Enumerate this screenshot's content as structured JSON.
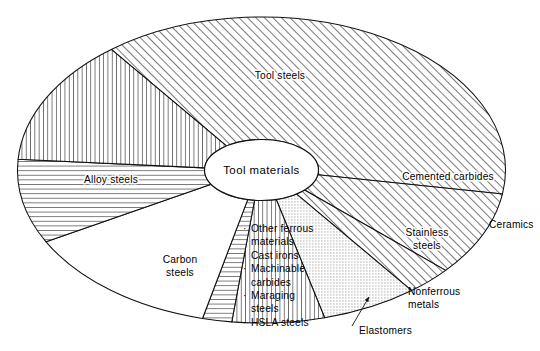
{
  "figure": {
    "hub_label": "Tool materials",
    "center": {
      "x": 261.5,
      "y": 170
    },
    "radius": {
      "x": 244,
      "y": 153
    },
    "hub_radius": {
      "x": 57,
      "y": 30.5
    }
  },
  "chart_data": {
    "type": "pie",
    "title": "Tool materials",
    "xlabel": "",
    "ylabel": "",
    "legend": "none",
    "grid": false,
    "categories": [
      "Tool steels",
      "Cemented carbides",
      "Ceramics",
      "Stainless steels",
      "Nonferrous metals",
      "Elastomers",
      "Other ferrous materials",
      "Carbon steels",
      "Alloy steels"
    ],
    "values": [
      38.0,
      9.0,
      3.0,
      6.5,
      6.0,
      2.0,
      13.5,
      8.5,
      13.5
    ],
    "units": "percent of circumference",
    "slices": [
      {
        "label": "Tool steels",
        "start_angle": 232,
        "end_angle": 369,
        "value": 38.0,
        "fill": "diagonal-hatch",
        "label_x": 280,
        "label_y": 79,
        "label_anchor": "middle",
        "label_inside": true
      },
      {
        "label": "Cemented carbides",
        "start_angle": 9,
        "end_angle": 41,
        "value": 9.0,
        "fill": "diagonal-hatch",
        "label_x": 448,
        "label_y": 180,
        "label_anchor": "middle",
        "label_inside": true
      },
      {
        "label": "Ceramics",
        "start_angle": 41,
        "end_angle": 52,
        "value": 3.0,
        "fill": "diagonal-hatch",
        "label_x": 489,
        "label_y": 228,
        "label_anchor": "start",
        "label_inside": false
      },
      {
        "label": "Stainless steels",
        "start_angle": 52,
        "end_angle": 75,
        "value": 6.5,
        "fill": "stipple",
        "label_x": 427,
        "label_y": 236,
        "label_anchor": "middle",
        "label_inside": true,
        "lines": [
          "Stainless",
          "steels"
        ]
      },
      {
        "label": "Nonferrous metals",
        "start_angle": 75,
        "end_angle": 97,
        "value": 6.0,
        "fill": "vertical-hatch",
        "label_x": 408,
        "label_y": 295,
        "label_anchor": "start",
        "label_inside": false,
        "lines": [
          "Nonferrous",
          "metals"
        ]
      },
      {
        "label": "Elastomers",
        "start_angle": 97,
        "end_angle": 104,
        "value": 2.0,
        "fill": "horizontal-hatch",
        "label_x": 359,
        "label_y": 334,
        "label_anchor": "start",
        "label_inside": false,
        "leader": {
          "x1": 352,
          "y1": 326,
          "x2": 369,
          "y2": 297
        }
      },
      {
        "label": "Other ferrous materials",
        "start_angle": 104,
        "end_angle": 152,
        "value": 13.5,
        "fill": "none",
        "label_x": 243,
        "label_y": 232,
        "label_anchor": "start",
        "label_inside": true,
        "bullets": [
          "Other ferrous",
          "materials",
          "Cast irons",
          "Machinable",
          "carbides",
          "Maraging",
          "steels",
          "HSLA steels"
        ],
        "bullet_flags": [
          true,
          false,
          true,
          true,
          false,
          true,
          false,
          true
        ]
      },
      {
        "label": "Carbon steels",
        "start_angle": 152,
        "end_angle": 184,
        "value": 8.5,
        "fill": "horizontal-hatch",
        "label_x": 180,
        "label_y": 263,
        "label_anchor": "middle",
        "label_inside": true,
        "lines": [
          "Carbon",
          "steels"
        ]
      },
      {
        "label": "Alloy steels",
        "start_angle": 184,
        "end_angle": 232,
        "value": 13.5,
        "fill": "vertical-hatch",
        "label_x": 111,
        "label_y": 183,
        "label_anchor": "middle",
        "label_inside": true
      }
    ]
  },
  "colors": {
    "stroke": "#111111",
    "background": "#ffffff",
    "hatch": "#2a2a2a",
    "stipple": "#9a9a9a"
  }
}
